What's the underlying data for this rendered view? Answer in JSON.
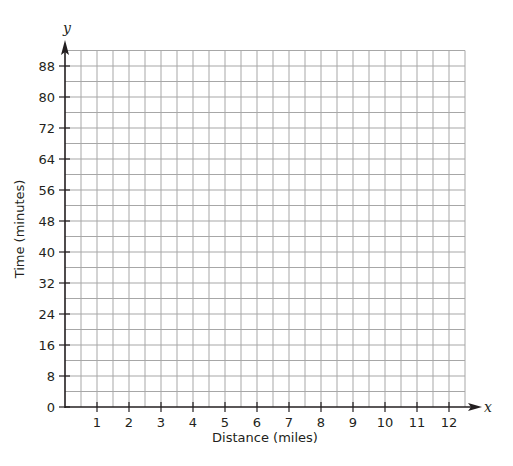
{
  "chart_data": {
    "type": "scatter",
    "title": "",
    "xlabel": "Distance (miles)",
    "ylabel": "Time (minutes)",
    "x_axis_variable": "x",
    "y_axis_variable": "y",
    "x_ticks": [
      1,
      2,
      3,
      4,
      5,
      6,
      7,
      8,
      9,
      10,
      11,
      12
    ],
    "y_ticks": [
      0,
      8,
      16,
      24,
      32,
      40,
      48,
      56,
      64,
      72,
      80,
      88
    ],
    "xlim": [
      0,
      12.5
    ],
    "ylim": [
      0,
      92
    ],
    "x_minor_step": 0.5,
    "y_minor_step": 4,
    "grid": true,
    "series": [],
    "legend": null
  },
  "colors": {
    "grid": "#a7a7a7",
    "axis": "#231f20",
    "text": "#231f20",
    "background": "#ffffff"
  }
}
